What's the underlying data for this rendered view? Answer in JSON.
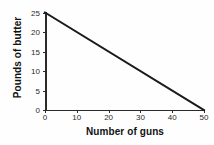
{
  "chart_data": {
    "type": "line",
    "title": "",
    "subtitle": "",
    "xlabel": "Number of guns",
    "ylabel": "Pounds of butter",
    "xlim": [
      0,
      50
    ],
    "ylim": [
      0,
      25
    ],
    "xticks": [
      0,
      10,
      20,
      30,
      40,
      50
    ],
    "yticks": [
      0,
      5,
      10,
      15,
      20,
      25
    ],
    "xticklabels": [
      "0",
      "10",
      "20",
      "30",
      "40",
      "50"
    ],
    "yticklabels": [
      "0",
      "5",
      "10",
      "15",
      "20",
      "25"
    ],
    "grid": false,
    "legend": null,
    "annotations": [],
    "series": [
      {
        "name": "Production possibilities frontier",
        "color": "#1a1a1a",
        "linewidth": 2,
        "x": [
          0,
          50
        ],
        "values": [
          25,
          0
        ],
        "points": [
          {
            "x": 0,
            "y": 25
          },
          {
            "x": 50,
            "y": 0
          }
        ]
      }
    ],
    "axis_color": "#2b2b2b",
    "background": "#fefefe"
  }
}
